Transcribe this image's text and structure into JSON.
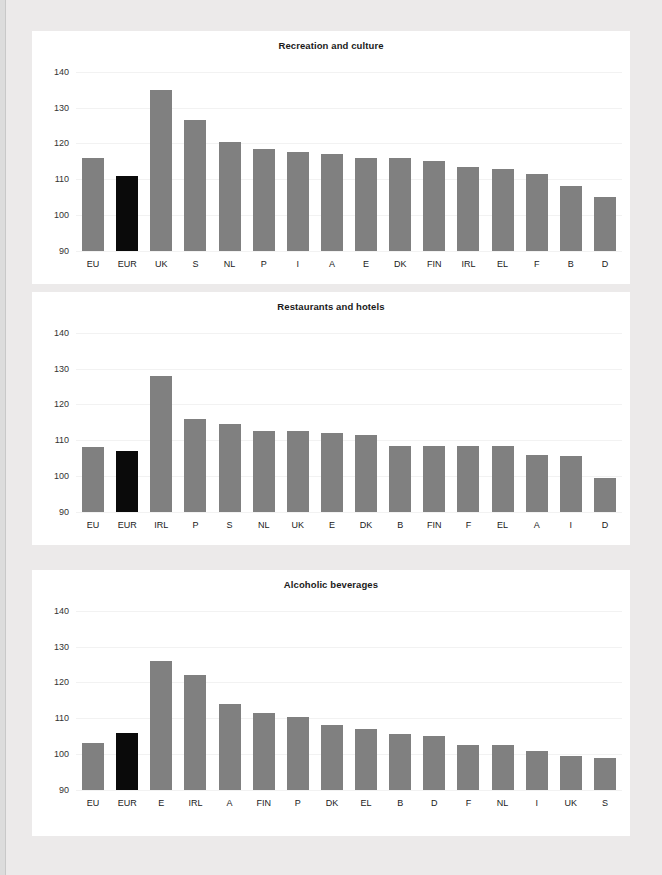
{
  "theme": {
    "page_background": "#eceaea",
    "panel_background": "#ffffff",
    "bar_color": "#808080",
    "highlight_bar_color": "#0a0a0a",
    "gridline_color": "#f2f2f2",
    "text_color": "#1a1a1a"
  },
  "chart_data": [
    {
      "type": "bar",
      "title": "Recreation and culture",
      "xlabel": "",
      "ylabel": "",
      "ylim": [
        90,
        143
      ],
      "yticks": [
        90,
        100,
        110,
        120,
        130,
        140
      ],
      "baseline": 90,
      "grid": true,
      "legend": "none",
      "highlight_categories": [
        "EUR"
      ],
      "categories": [
        "EU",
        "EUR",
        "UK",
        "S",
        "NL",
        "P",
        "I",
        "A",
        "E",
        "DK",
        "FIN",
        "IRL",
        "EL",
        "F",
        "B",
        "D"
      ],
      "values": [
        116,
        111,
        135,
        126.5,
        120.5,
        118.5,
        117.5,
        117,
        116,
        116,
        115,
        113.5,
        113,
        111.5,
        108,
        105
      ]
    },
    {
      "type": "bar",
      "title": "Restaurants and hotels",
      "xlabel": "",
      "ylabel": "",
      "ylim": [
        90,
        143
      ],
      "yticks": [
        90,
        100,
        110,
        120,
        130,
        140
      ],
      "baseline": 90,
      "grid": true,
      "legend": "none",
      "highlight_categories": [
        "EUR"
      ],
      "categories": [
        "EU",
        "EUR",
        "IRL",
        "P",
        "S",
        "NL",
        "UK",
        "E",
        "DK",
        "B",
        "FIN",
        "F",
        "EL",
        "A",
        "I",
        "D"
      ],
      "values": [
        108,
        107,
        128,
        116,
        114.5,
        112.5,
        112.5,
        112,
        111.5,
        108.5,
        108.5,
        108.5,
        108.5,
        106,
        105.5,
        99.5
      ]
    },
    {
      "type": "bar",
      "title": "Alcoholic beverages",
      "xlabel": "",
      "ylabel": "",
      "ylim": [
        90,
        143
      ],
      "yticks": [
        90,
        100,
        110,
        120,
        130,
        140
      ],
      "baseline": 90,
      "grid": true,
      "legend": "none",
      "highlight_categories": [
        "EUR"
      ],
      "categories": [
        "EU",
        "EUR",
        "E",
        "IRL",
        "A",
        "FIN",
        "P",
        "DK",
        "EL",
        "B",
        "D",
        "F",
        "NL",
        "I",
        "UK",
        "S"
      ],
      "values": [
        103,
        106,
        126,
        122,
        114,
        111.5,
        110.5,
        108,
        107,
        105.5,
        105,
        102.5,
        102.5,
        101,
        99.5,
        99
      ]
    }
  ]
}
